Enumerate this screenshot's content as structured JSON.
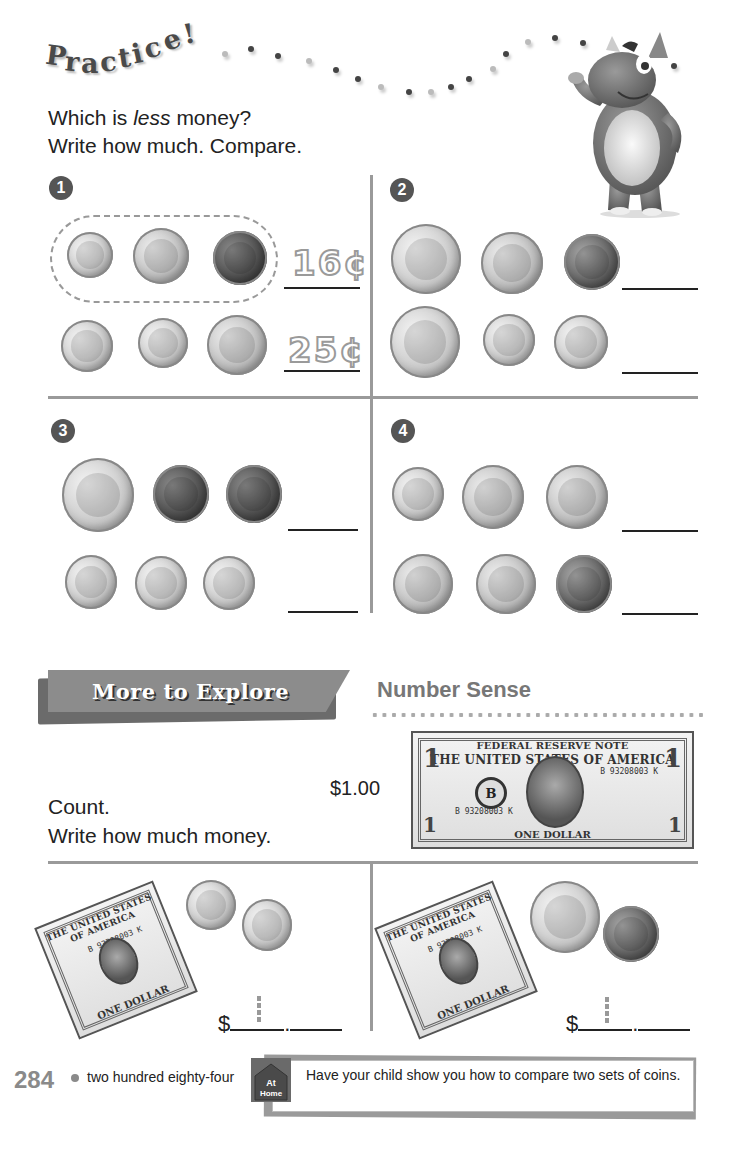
{
  "header": {
    "title_letters": [
      "P",
      "r",
      "a",
      "c",
      "t",
      "i",
      "c",
      "e",
      "!"
    ],
    "instructions": {
      "line1_before": "Which is ",
      "line1_em": "less",
      "line1_after": " money?",
      "line2": "Write how much. Compare."
    }
  },
  "problems": [
    {
      "number": "1",
      "rows": [
        {
          "coins": [
            "dime",
            "nickel",
            "penny"
          ],
          "answer": "16¢",
          "circled": true
        },
        {
          "coins": [
            "dime",
            "dime",
            "nickel"
          ],
          "answer": "25¢",
          "circled": false
        }
      ]
    },
    {
      "number": "2",
      "rows": [
        {
          "coins": [
            "quarter",
            "nickel",
            "penny"
          ],
          "answer": ""
        },
        {
          "coins": [
            "quarter",
            "dime",
            "dime"
          ],
          "answer": ""
        }
      ]
    },
    {
      "number": "3",
      "rows": [
        {
          "coins": [
            "quarter",
            "penny",
            "penny"
          ],
          "answer": ""
        },
        {
          "coins": [
            "dime",
            "dime",
            "dime"
          ],
          "answer": ""
        }
      ]
    },
    {
      "number": "4",
      "rows": [
        {
          "coins": [
            "dime",
            "nickel",
            "nickel"
          ],
          "answer": ""
        },
        {
          "coins": [
            "nickel",
            "nickel",
            "penny"
          ],
          "answer": ""
        }
      ]
    }
  ],
  "more_to_explore": {
    "banner": "More to Explore",
    "subtitle": "Number Sense",
    "instructions": {
      "line1": "Count.",
      "line2": "Write how much money."
    },
    "example_value": "$1.00",
    "bill": {
      "header": "FEDERAL RESERVE NOTE",
      "country": "THE UNITED STATES OF AMERICA",
      "serial": "B 93208003 K",
      "seal_letter": "B",
      "denomination_text": "ONE DOLLAR",
      "corner": "1"
    },
    "exercises": [
      {
        "items": [
          "one-dollar bill",
          "dime",
          "dime"
        ],
        "dollar_sign": "$",
        "decimal": "."
      },
      {
        "items": [
          "one-dollar bill",
          "quarter",
          "penny"
        ],
        "dollar_sign": "$",
        "decimal": "."
      }
    ]
  },
  "footer": {
    "page_number": "284",
    "page_words": "two hundred eighty-four",
    "at_home_label_1": "At",
    "at_home_label_2": "Home",
    "at_home_text": "Have your child show you how to compare two sets of coins."
  }
}
